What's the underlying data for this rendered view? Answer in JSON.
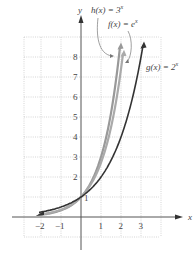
{
  "chart_data": {
    "type": "line",
    "title": "",
    "xlabel": "x",
    "ylabel": "y",
    "xlim": [
      -3,
      4
    ],
    "ylim": [
      -1,
      9
    ],
    "grid": true,
    "x_ticks": [
      "-2",
      "-1",
      "1",
      "2",
      "3"
    ],
    "y_ticks": [
      "1",
      "2",
      "3",
      "4",
      "5",
      "6",
      "7",
      "8"
    ],
    "series": [
      {
        "name": "h(x) = 3^x",
        "label": "h(x) = 3",
        "exp": "x",
        "color": "#999999",
        "x": [
          -2,
          -1,
          0,
          1,
          1.5,
          1.95
        ],
        "values": [
          0.11,
          0.33,
          1,
          3,
          5.2,
          8.5
        ]
      },
      {
        "name": "f(x) = e^x",
        "label": "f(x) = e",
        "exp": "x",
        "color": "#aaaaaa",
        "x": [
          -2,
          -1,
          0,
          1,
          1.5,
          2.1
        ],
        "values": [
          0.14,
          0.37,
          1,
          2.72,
          4.48,
          8.2
        ]
      },
      {
        "name": "g(x) = 2^x",
        "label": "g(x) = 2",
        "exp": "x",
        "color": "#333333",
        "x": [
          -2,
          -1,
          0,
          1,
          2,
          3,
          3.1
        ],
        "values": [
          0.25,
          0.5,
          1,
          2,
          4,
          8,
          8.6
        ]
      }
    ],
    "annotations": [
      "1"
    ]
  }
}
